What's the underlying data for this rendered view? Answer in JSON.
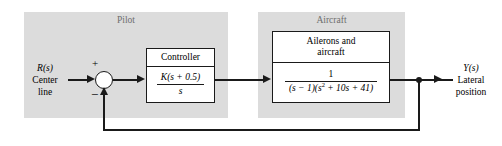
{
  "diagram": {
    "type": "control-system-block-diagram",
    "colors": {
      "region_fill": "#dcdcdc",
      "block_fill": "#ffffff",
      "line": "#1a1a1a",
      "region_label": "#6e6e6e",
      "background": "#ffffff"
    },
    "regions": [
      {
        "name": "pilot",
        "label": "Pilot"
      },
      {
        "name": "aircraft",
        "label": "Aircraft"
      }
    ],
    "blocks": [
      {
        "name": "controller",
        "title": "Controller",
        "numerator": "K(s + 0.5)",
        "denominator": "s",
        "transfer_function": "K(s + 0.5)/s"
      },
      {
        "name": "ailerons-and-aircraft",
        "title_line1": "Ailerons and",
        "title_line2": "aircraft",
        "numerator": "1",
        "denominator_prefix": "(s − 1)(s",
        "denominator_exponent": "2",
        "denominator_suffix": " + 10s + 41)",
        "transfer_function": "1/((s − 1)(s^2 + 10s + 41))"
      }
    ],
    "summing_junction": {
      "name": "summing-junction",
      "plus_sign": "+",
      "minus_sign": "−",
      "input_sign": "+",
      "feedback_sign": "−"
    },
    "input_signal": {
      "symbol": "R(s)",
      "symbol_var": "R",
      "symbol_arg": "(s)",
      "line1": "Center",
      "line2": "line"
    },
    "output_signal": {
      "symbol": "Y(s)",
      "symbol_var": "Y",
      "symbol_arg": "(s)",
      "line1": "Lateral",
      "line2": "position"
    },
    "feedback": {
      "name": "unity-feedback-path",
      "description": "unity negative feedback from output to summing junction"
    }
  }
}
